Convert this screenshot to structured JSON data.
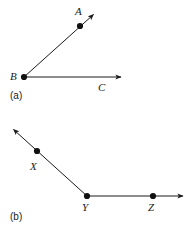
{
  "figure": {
    "background_color": "#ffffff",
    "stroke_color": "#1a1a1a",
    "point_color": "#111111",
    "panels": [
      {
        "id": "panel-a",
        "caption": "(a)",
        "caption_x": 10,
        "caption_y": 91,
        "description": "Angle formed by two rays sharing vertex B",
        "vertex": {
          "label": "B",
          "label_x": 10,
          "label_y": 71,
          "dot_x": 24,
          "dot_y": 77,
          "dot_r": 3.1
        },
        "rays": [
          {
            "name": "ray-BA",
            "label": "A",
            "label_x": 75,
            "label_y": 6,
            "from_x": 24,
            "from_y": 77,
            "to_x": 96,
            "to_y": 12,
            "point": {
              "label": "A",
              "dot_x": 80,
              "dot_y": 26,
              "dot_r": 3.1
            },
            "arrow": true
          },
          {
            "name": "ray-BC",
            "label": "C",
            "label_x": 98,
            "label_y": 82,
            "from_x": 24,
            "from_y": 77,
            "to_x": 124,
            "to_y": 77,
            "point": null,
            "arrow": true
          }
        ]
      },
      {
        "id": "panel-b",
        "caption": "(b)",
        "caption_x": 10,
        "caption_y": 212,
        "description": "Straight-ish path with vertex Y, ray through X and ray through Z",
        "vertex": {
          "label": "Y",
          "label_x": 82,
          "label_y": 202,
          "dot_x": 87,
          "dot_y": 196,
          "dot_r": 3.1
        },
        "rays": [
          {
            "name": "ray-YX",
            "label": "X",
            "label_x": 30,
            "label_y": 161,
            "from_x": 87,
            "from_y": 196,
            "to_x": 11,
            "to_y": 127,
            "point": {
              "label": "X",
              "dot_x": 37,
              "dot_y": 151,
              "dot_r": 3.1
            },
            "arrow": true
          },
          {
            "name": "ray-YZ",
            "label": "Z",
            "label_x": 148,
            "label_y": 202,
            "from_x": 87,
            "from_y": 196,
            "to_x": 186,
            "to_y": 196,
            "point": {
              "label": "Z",
              "dot_x": 153,
              "dot_y": 196,
              "dot_r": 3.1
            },
            "arrow": true
          }
        ]
      }
    ]
  }
}
